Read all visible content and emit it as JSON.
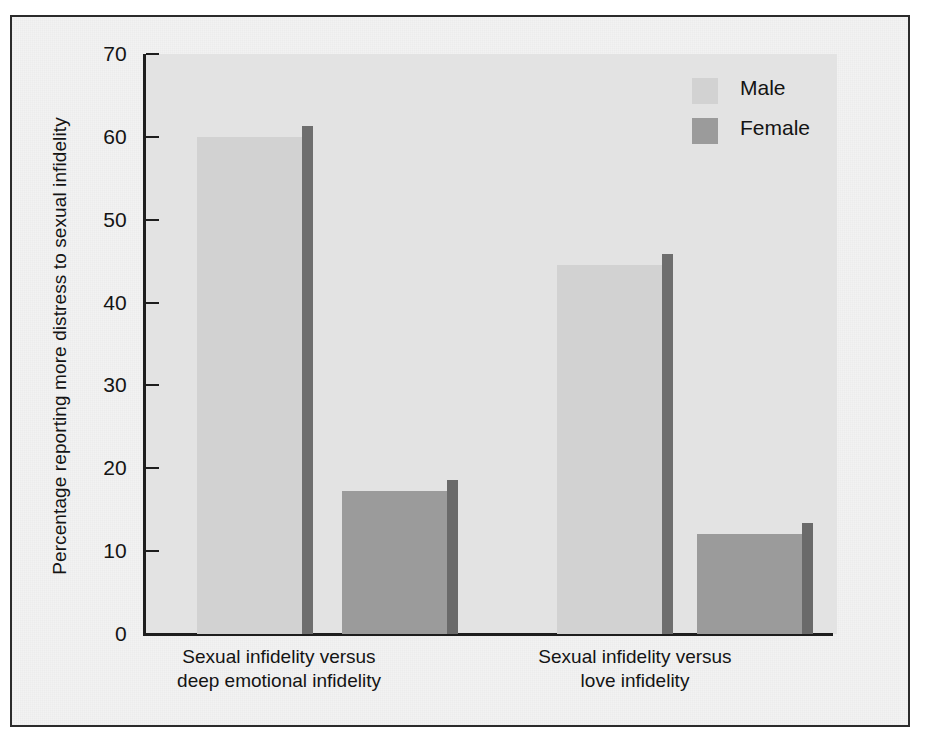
{
  "chart_data": {
    "type": "bar",
    "title": "",
    "subtitle": "",
    "xlabel": "",
    "ylabel": "Percentage reporting more distress to sexual infidelity",
    "ylim": [
      0,
      70
    ],
    "ytick_labels": [
      "70",
      "60",
      "50",
      "40",
      "30",
      "20",
      "10",
      "0"
    ],
    "ytick_values": [
      70,
      60,
      50,
      40,
      30,
      20,
      10,
      0
    ],
    "grid": false,
    "legend_position": "top-right",
    "categories": [
      "Sexual infidelity versus deep emotional infidelity",
      "Sexual infidelity versus love infidelity"
    ],
    "category_lines": [
      [
        "Sexual infidelity versus",
        "deep emotional infidelity"
      ],
      [
        "Sexual infidelity versus",
        "love infidelity"
      ]
    ],
    "series": [
      {
        "name": "Male",
        "values": [
          60,
          44.5
        ],
        "color": "#d2d2d2",
        "shadow_color": "#6e6e6e"
      },
      {
        "name": "Female",
        "values": [
          17.3,
          12.1
        ],
        "color": "#9b9b9b",
        "shadow_color": "#6a6a6a"
      }
    ],
    "annotations": []
  },
  "legend": {
    "items": [
      {
        "label": "Male"
      },
      {
        "label": "Female"
      }
    ]
  },
  "colors": {
    "frame_border": "#2b2b2b",
    "plot_background": "#e3e3e3",
    "page_background": "#f2f2f2",
    "axis": "#1e1e1e",
    "text": "#141414"
  }
}
